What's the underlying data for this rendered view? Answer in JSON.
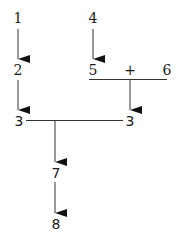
{
  "diagram": {
    "nodes": {
      "n1": "1",
      "n2": "2",
      "n3_left": "3",
      "n4": "4",
      "n5": "5",
      "plus": "+",
      "n6": "6",
      "n3_right": "3",
      "n7": "7",
      "n8": "8"
    },
    "edges": [
      {
        "from": "1",
        "to": "2",
        "type": "arrow"
      },
      {
        "from": "2",
        "to": "3 (left)",
        "type": "arrow"
      },
      {
        "from": "4",
        "to": "5",
        "type": "arrow"
      },
      {
        "from": "5 + 6",
        "to": "3 (right)",
        "type": "arrow"
      },
      {
        "from": "3 (left) — 3 (right)",
        "to": "7",
        "type": "arrow"
      },
      {
        "from": "7",
        "to": "8",
        "type": "arrow"
      }
    ],
    "colors": {
      "line": "#333333",
      "text": "#1a1a1a",
      "background": "#ffffff"
    }
  }
}
